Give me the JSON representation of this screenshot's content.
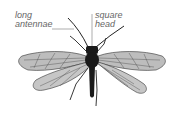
{
  "figure": {
    "labels": {
      "antennae_line1": "long",
      "antennae_line2": "antennae",
      "head_line1": "square",
      "head_line2": "head"
    }
  },
  "colors": {
    "background": "#ffffff",
    "label_text": "#666666",
    "leader_line": "#777777",
    "body": "#1a1a1a",
    "wing_fill": "#b8b8b8",
    "wing_vein": "#333333"
  }
}
